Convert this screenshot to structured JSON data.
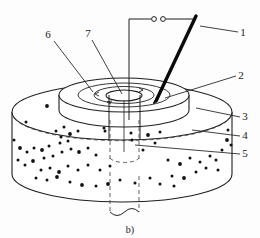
{
  "figure": {
    "caption": "b)",
    "background_color": "#fdfdfd",
    "line_color": "#1f1f1f",
    "speckle_color": "#111111",
    "probe_color": "#0a0a0a",
    "width": 260,
    "height": 238
  },
  "callouts": [
    {
      "id": "1",
      "label": "1",
      "text_x": 243,
      "text_y": 36,
      "leader": {
        "x1": 238,
        "y1": 32,
        "x2": 200,
        "y2": 26
      },
      "target": "probe-electrode"
    },
    {
      "id": "2",
      "label": "2",
      "text_x": 241,
      "text_y": 79,
      "leader": {
        "x1": 236,
        "y1": 76,
        "x2": 165,
        "y2": 98
      },
      "target": "raised-disk-top"
    },
    {
      "id": "3",
      "label": "3",
      "text_x": 245,
      "text_y": 120,
      "leader": {
        "x1": 240,
        "y1": 117,
        "x2": 196,
        "y2": 108
      },
      "target": "cylinder-top-rim"
    },
    {
      "id": "4",
      "label": "4",
      "text_x": 245,
      "text_y": 139,
      "leader": {
        "x1": 240,
        "y1": 136,
        "x2": 192,
        "y2": 130
      },
      "target": "cylinder-body"
    },
    {
      "id": "5",
      "label": "5",
      "text_x": 245,
      "text_y": 157,
      "leader": {
        "x1": 240,
        "y1": 154,
        "x2": 135,
        "y2": 145
      },
      "target": "central-bore"
    },
    {
      "id": "6",
      "label": "6",
      "text_x": 48,
      "text_y": 38,
      "leader": {
        "x1": 54,
        "y1": 41,
        "x2": 93,
        "y2": 92
      },
      "target": "raised-disk-surface"
    },
    {
      "id": "7",
      "label": "7",
      "text_x": 88,
      "text_y": 37,
      "leader": {
        "x1": 92,
        "y1": 40,
        "x2": 122,
        "y2": 94
      },
      "target": "bore-mouth"
    }
  ],
  "circuit": {
    "terminal_left_cx": 154,
    "terminal_right_cx": 163,
    "terminal_cy": 19,
    "terminal_r": 2.4,
    "lead_left_x": 129,
    "lead_down_y": 120,
    "lead_right_x": 193
  },
  "probe": {
    "tip_x": 156,
    "tip_y": 101,
    "top_x": 196,
    "top_y": 16,
    "width": 3.2
  },
  "geometry": {
    "cylinder": {
      "cx": 122,
      "cy_top": 112,
      "rx": 110,
      "ry": 28,
      "height": 62,
      "left_x": 12,
      "right_x": 232
    },
    "disk": {
      "cx": 124,
      "cy_top": 95,
      "rx": 65,
      "ry": 17,
      "height": 15
    },
    "bore": {
      "cx": 124,
      "cy": 95,
      "rx": 18,
      "ry": 6,
      "shaft_left": 109,
      "shaft_right": 140,
      "shaft_bottom": 165,
      "tail_bottom": 215
    }
  },
  "speckles": [
    [
      47,
      106
    ],
    [
      74,
      96
    ],
    [
      96,
      92
    ],
    [
      139,
      92
    ],
    [
      160,
      90
    ],
    [
      178,
      96
    ],
    [
      26,
      122
    ],
    [
      56,
      131
    ],
    [
      64,
      127
    ],
    [
      61,
      137
    ],
    [
      70,
      134
    ],
    [
      78,
      131
    ],
    [
      60,
      143
    ],
    [
      68,
      141
    ],
    [
      49,
      146
    ],
    [
      42,
      150
    ],
    [
      34,
      148
    ],
    [
      27,
      152
    ],
    [
      18,
      160
    ],
    [
      25,
      165
    ],
    [
      33,
      161
    ],
    [
      44,
      158
    ],
    [
      53,
      156
    ],
    [
      62,
      152
    ],
    [
      71,
      149
    ],
    [
      79,
      152
    ],
    [
      88,
      148
    ],
    [
      96,
      155
    ],
    [
      41,
      170
    ],
    [
      50,
      168
    ],
    [
      59,
      172
    ],
    [
      68,
      166
    ],
    [
      78,
      170
    ],
    [
      36,
      178
    ],
    [
      47,
      180
    ],
    [
      57,
      177
    ],
    [
      88,
      165
    ],
    [
      100,
      170
    ],
    [
      110,
      166
    ],
    [
      70,
      182
    ],
    [
      82,
      185
    ],
    [
      105,
      131
    ],
    [
      131,
      133
    ],
    [
      132,
      140
    ],
    [
      104,
      128
    ],
    [
      148,
      135
    ],
    [
      160,
      132
    ],
    [
      155,
      143
    ],
    [
      143,
      150
    ],
    [
      168,
      160
    ],
    [
      180,
      164
    ],
    [
      190,
      158
    ],
    [
      200,
      162
    ],
    [
      210,
      156
    ],
    [
      172,
      176
    ],
    [
      184,
      178
    ],
    [
      196,
      172
    ],
    [
      206,
      168
    ],
    [
      216,
      160
    ],
    [
      222,
      150
    ],
    [
      227,
      140
    ],
    [
      120,
      180
    ],
    [
      135,
      183
    ],
    [
      150,
      178
    ],
    [
      96,
      186
    ],
    [
      108,
      184
    ],
    [
      160,
      184
    ],
    [
      174,
      186
    ],
    [
      218,
      170
    ],
    [
      14,
      140
    ],
    [
      20,
      148
    ],
    [
      228,
      130
    ],
    [
      231,
      145
    ]
  ]
}
